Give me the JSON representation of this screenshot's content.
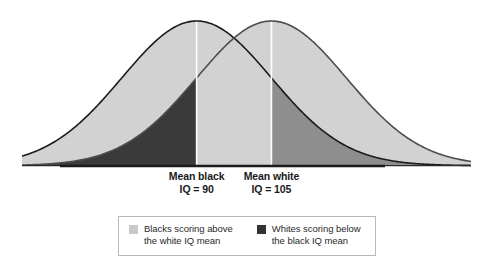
{
  "chart_data": {
    "type": "area",
    "title": "",
    "subtitle": "",
    "xlabel": "",
    "ylabel": "",
    "grid": false,
    "legend_position": "bottom-center",
    "xlim": [
      55,
      145
    ],
    "ylim": [
      0,
      1
    ],
    "annotations": [
      {
        "name": "black-mean-marker",
        "line_1": "Mean black",
        "line_2": "IQ = 90",
        "value": 90,
        "x_px": 212
      },
      {
        "name": "white-mean-marker",
        "line_1": "Mean white",
        "line_2": "IQ = 105",
        "value": 105,
        "x_px": 263
      }
    ],
    "series": [
      {
        "name": "Black IQ distribution",
        "mean": 90,
        "sd": 15,
        "curve_color": "#1b1b1b",
        "fill_color": "#d2d2d2"
      },
      {
        "name": "White IQ distribution",
        "mean": 105,
        "sd": 15,
        "curve_color": "#4d4d4d",
        "fill_color": "#d2d2d2"
      }
    ],
    "shaded_regions": [
      {
        "name": "whites-below-black-mean",
        "description": "Whites scoring below the black IQ mean",
        "color": "#3a3a3a",
        "x_range": [
          55,
          90
        ]
      },
      {
        "name": "blacks-above-white-mean",
        "description": "Blacks scoring above the white IQ mean",
        "color": "#8e8e8e",
        "x_range": [
          105,
          145
        ]
      }
    ]
  },
  "labels": {
    "black_mean": {
      "line_1": "Mean black",
      "line_2": "IQ = 90"
    },
    "white_mean": {
      "line_1": "Mean white",
      "line_2": "IQ = 105"
    }
  },
  "legend": {
    "entries": [
      {
        "swatch_name": "legend-swatch-light",
        "swatch_color": "#c9c9c9",
        "line_1": "Blacks scoring above",
        "line_2": "the white IQ mean"
      },
      {
        "swatch_name": "legend-swatch-dark",
        "swatch_color": "#333333",
        "line_1": "Whites scoring below",
        "line_2": "the black IQ mean"
      }
    ]
  },
  "colors": {
    "background": "#ffffff",
    "baseline": "#2b2b2b",
    "curve_black": "#1b1b1b",
    "curve_white": "#4d4d4d",
    "fill_light": "#d2d2d2",
    "fill_medium": "#8e8e8e",
    "fill_dark": "#3a3a3a",
    "mean_line": "#ffffff",
    "legend_border": "#b9b9b9",
    "text": "#1a1a1a"
  }
}
